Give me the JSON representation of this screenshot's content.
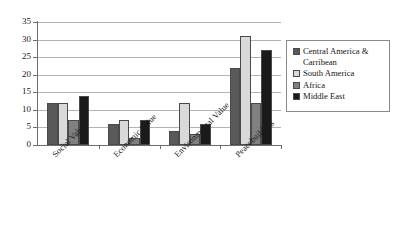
{
  "chart_data": {
    "type": "bar",
    "title": "",
    "subtitle": "",
    "xlabel": "",
    "ylabel": "",
    "ylim": [
      0,
      35
    ],
    "ytick_step": 5,
    "yticks": [
      "0",
      "5",
      "10",
      "15",
      "20",
      "25",
      "30",
      "35"
    ],
    "grid": true,
    "grid_orientation": "horizontal",
    "legend_position": "right",
    "orientation": "vertical",
    "grouping": "grouped",
    "categories": [
      "Social Value",
      "Economic Value",
      "Environmental Value",
      "Peacebuilding"
    ],
    "series": [
      {
        "name": "Central America & Carribean",
        "color": "#595959",
        "values": [
          12,
          6,
          4,
          22
        ]
      },
      {
        "name": "South America",
        "color": "#d9d9d9",
        "values": [
          12,
          7,
          12,
          31
        ]
      },
      {
        "name": "Africa",
        "color": "#808080",
        "values": [
          7,
          2,
          3,
          12
        ]
      },
      {
        "name": "Middle East",
        "color": "#1a1a1a",
        "values": [
          14,
          7,
          6,
          27
        ]
      }
    ]
  },
  "legend": {
    "items": [
      {
        "label": "Central America & Carribean",
        "color": "#595959"
      },
      {
        "label": "South America",
        "color": "#d9d9d9"
      },
      {
        "label": "Africa",
        "color": "#808080"
      },
      {
        "label": "Middle East",
        "color": "#1a1a1a"
      }
    ]
  },
  "axes": {
    "y": {
      "ticks": [
        "35",
        "30",
        "25",
        "20",
        "15",
        "10",
        "5",
        "0"
      ]
    },
    "x": {
      "ticks": [
        "Social Value",
        "Economic Value",
        "Environmental Value",
        "Peacebuilding"
      ]
    }
  }
}
